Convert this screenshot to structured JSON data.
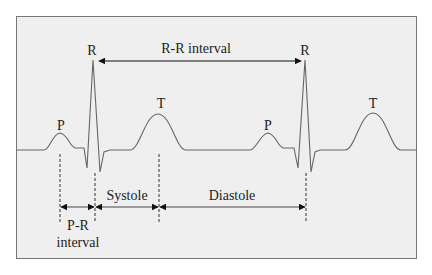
{
  "diagram": {
    "type": "ECG waveform",
    "waves": [
      {
        "label": "P",
        "x": 61,
        "y": 126
      },
      {
        "label": "R",
        "x": 92,
        "y": 53
      },
      {
        "label": "T",
        "x": 161,
        "y": 106
      },
      {
        "label": "P",
        "x": 268,
        "y": 126
      },
      {
        "label": "R",
        "x": 305,
        "y": 53
      },
      {
        "label": "T",
        "x": 373,
        "y": 106
      }
    ],
    "intervals": {
      "rr": "R-R interval",
      "pr_line1": "P-R",
      "pr_line2": "interval",
      "systole": "Systole",
      "diastole": "Diastole"
    },
    "colors": {
      "background": "#efefef",
      "border": "#777777",
      "trace": "#666666",
      "arrow": "#111111",
      "text": "#222222"
    }
  }
}
